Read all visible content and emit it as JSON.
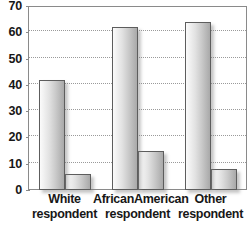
{
  "chart_data": {
    "type": "bar",
    "title": "",
    "subtitle": "",
    "xlabel": "",
    "ylabel": "",
    "ylim": [
      0,
      70
    ],
    "ytick_labels": [
      "0",
      "10",
      "20",
      "30",
      "40",
      "50",
      "60",
      "70"
    ],
    "ytick_values": [
      0,
      10,
      20,
      30,
      40,
      50,
      60,
      70
    ],
    "grid": true,
    "grid_axis": "y",
    "grid_style": "dotted",
    "legend": false,
    "legend_position": "none",
    "categories": [
      "White respondent",
      "AfricanAmerican respondent",
      "Other respondent"
    ],
    "category_lines": [
      [
        "White",
        "respondent"
      ],
      [
        "AfricanAmerican",
        "respondent"
      ],
      [
        "Other",
        "respondent"
      ]
    ],
    "series": [
      {
        "name": "Series 1",
        "values": [
          42,
          62,
          64
        ]
      },
      {
        "name": "Series 2",
        "values": [
          6,
          15,
          8
        ]
      }
    ],
    "bar_style": {
      "fill_gradient_from": "#fbfbfb",
      "fill_gradient_to": "#a9a9a9",
      "border_color": "#5d5d5d",
      "shadow_color": "#787878"
    },
    "axis_color": "#8a8a8a",
    "grid_color": "#9a9a9a",
    "text_color": "#171717",
    "background": "#ffffff"
  }
}
